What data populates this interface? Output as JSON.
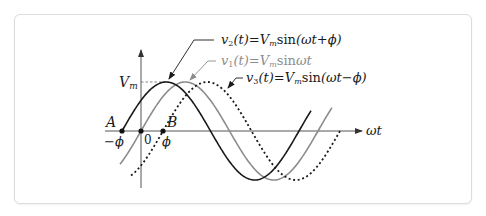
{
  "figure": {
    "labels": {
      "vm": "V",
      "vm_sub": "m",
      "A": "A",
      "B": "B",
      "zero": "0",
      "neg_phi": "−ϕ",
      "phi": "ϕ",
      "omega_t": "ωt"
    },
    "equations": {
      "v2": {
        "lhs": "v",
        "sub": "2",
        "arg": "(t)",
        "eq": "=",
        "V": "V",
        "Vsub": "m",
        "fn": "sin",
        "rhs": "(ωt+ϕ)"
      },
      "v1": {
        "lhs": "v",
        "sub": "1",
        "arg": "(t)",
        "eq": "=",
        "V": "V",
        "Vsub": "m",
        "fn": "sin",
        "rhs": "ωt"
      },
      "v3": {
        "lhs": "v",
        "sub": "3",
        "arg": "(t)",
        "eq": "=",
        "V": "V",
        "Vsub": "m",
        "fn": "sin",
        "rhs": "(ωt−ϕ)"
      }
    },
    "colors": {
      "v2": "#1a1a1a",
      "v1": "#8c8c8c",
      "v3": "#1a1a1a",
      "axis": "#555555",
      "text_dark": "#1a1a1a",
      "text_gray": "#8c8c8c"
    }
  },
  "chart_data": {
    "type": "line",
    "title": "",
    "xlabel": "ωt",
    "ylabel": "",
    "amplitude_label": "Vm",
    "series": [
      {
        "name": "v2(t) = Vm sin(ωt + ϕ)",
        "phase": "+ϕ",
        "style": "solid-black",
        "zero_crossing_label": "A (−ϕ)"
      },
      {
        "name": "v1(t) = Vm sinωt",
        "phase": "0",
        "style": "solid-gray",
        "zero_crossing_label": "0"
      },
      {
        "name": "v3(t) = Vm sin(ωt − ϕ)",
        "phase": "−ϕ",
        "style": "dotted-black",
        "zero_crossing_label": "B (ϕ)"
      }
    ],
    "x_ticks": [
      "−ϕ",
      "0",
      "ϕ"
    ],
    "geometry": {
      "origin_x": 141,
      "axis_y": 131,
      "amp_px": 49,
      "period_px": 177,
      "phi_px": 21.5,
      "curves": [
        {
          "id": "v2",
          "x0": 122,
          "start": 122,
          "end": 311
        },
        {
          "id": "v1",
          "x0": 141,
          "start": 120,
          "end": 332
        },
        {
          "id": "v3",
          "x0": 163,
          "start": 131,
          "end": 341
        }
      ]
    }
  }
}
